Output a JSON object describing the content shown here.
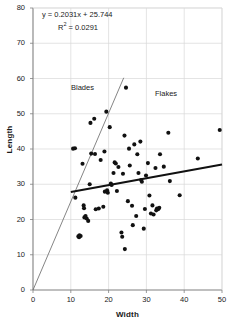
{
  "chart_data": {
    "type": "scatter",
    "title": "",
    "xlabel": "Width",
    "ylabel": "Length",
    "xlim": [
      0,
      50
    ],
    "ylim": [
      0,
      80
    ],
    "xticks": [
      0,
      10,
      20,
      30,
      40,
      50
    ],
    "yticks": [
      0,
      10,
      20,
      30,
      40,
      50,
      60,
      70,
      80
    ],
    "grid": true,
    "legend_position": "none",
    "annotations": [
      {
        "text": "Blades",
        "x": 10.2,
        "y": 58.5
      },
      {
        "text": "Flakes",
        "x": 32.5,
        "y": 56.5
      }
    ],
    "equation": "y = 0.2031x + 25.744",
    "r_squared_label": "R",
    "r_squared_exponent": "2",
    "r_squared_value": "= 0.0291",
    "series": [
      {
        "name": "observations",
        "marker": "filled-circle",
        "color": "#111111",
        "points": [
          [
            10.6,
            40.1
          ],
          [
            11.1,
            40.2
          ],
          [
            11.2,
            26.2
          ],
          [
            12.0,
            15.2
          ],
          [
            12.2,
            15.0
          ],
          [
            12.3,
            15.5
          ],
          [
            12.6,
            15.3
          ],
          [
            13.1,
            35.8
          ],
          [
            13.4,
            24.0
          ],
          [
            13.5,
            23.2
          ],
          [
            13.6,
            20.6
          ],
          [
            13.9,
            21.0
          ],
          [
            14.2,
            20.3
          ],
          [
            14.6,
            19.6
          ],
          [
            15.0,
            30.0
          ],
          [
            15.2,
            47.4
          ],
          [
            15.4,
            38.7
          ],
          [
            16.2,
            48.6
          ],
          [
            16.4,
            38.6
          ],
          [
            16.6,
            22.9
          ],
          [
            17.4,
            23.1
          ],
          [
            17.9,
            36.9
          ],
          [
            18.6,
            23.6
          ],
          [
            18.9,
            39.3
          ],
          [
            19.0,
            27.9
          ],
          [
            19.4,
            50.6
          ],
          [
            19.6,
            28.3
          ],
          [
            19.8,
            27.6
          ],
          [
            20.3,
            46.2
          ],
          [
            20.6,
            30.2
          ],
          [
            20.8,
            29.8
          ],
          [
            21.3,
            33.2
          ],
          [
            21.6,
            36.2
          ],
          [
            21.9,
            35.9
          ],
          [
            22.2,
            28.1
          ],
          [
            22.6,
            34.9
          ],
          [
            23.4,
            16.3
          ],
          [
            23.6,
            15.1
          ],
          [
            23.8,
            33.0
          ],
          [
            24.2,
            43.8
          ],
          [
            24.3,
            11.6
          ],
          [
            24.6,
            57.4
          ],
          [
            25.1,
            25.2
          ],
          [
            25.4,
            40.1
          ],
          [
            25.6,
            35.3
          ],
          [
            26.2,
            23.9
          ],
          [
            26.4,
            18.4
          ],
          [
            26.8,
            41.3
          ],
          [
            27.3,
            21.0
          ],
          [
            27.6,
            38.5
          ],
          [
            27.9,
            33.2
          ],
          [
            28.4,
            42.1
          ],
          [
            28.6,
            31.2
          ],
          [
            28.8,
            30.7
          ],
          [
            29.3,
            17.4
          ],
          [
            29.6,
            23.0
          ],
          [
            29.9,
            32.5
          ],
          [
            30.4,
            36.0
          ],
          [
            30.8,
            26.8
          ],
          [
            31.2,
            21.7
          ],
          [
            31.6,
            24.0
          ],
          [
            31.9,
            21.4
          ],
          [
            32.4,
            34.6
          ],
          [
            32.6,
            22.6
          ],
          [
            32.8,
            23.1
          ],
          [
            33.1,
            22.9
          ],
          [
            33.4,
            23.3
          ],
          [
            33.6,
            38.5
          ],
          [
            34.6,
            35.0
          ],
          [
            35.8,
            44.6
          ],
          [
            36.2,
            30.9
          ],
          [
            38.8,
            26.9
          ],
          [
            43.6,
            37.3
          ],
          [
            49.4,
            45.4
          ]
        ]
      }
    ],
    "lines": [
      {
        "name": "regression-trend",
        "style": "thick",
        "color": "#111111",
        "width_px": 2.2,
        "x0": 10.0,
        "y0": 27.8,
        "x1": 50.0,
        "y1": 35.6
      },
      {
        "name": "blade-flake-divider",
        "style": "thin",
        "color": "#666666",
        "width_px": 0.8,
        "x0": 0.0,
        "y0": 0.0,
        "x1": 24.0,
        "y1": 60.2
      }
    ]
  },
  "axes": {
    "y_tick_labels": [
      "80",
      "70",
      "60",
      "50",
      "40",
      "30",
      "20",
      "10",
      "0"
    ],
    "x_tick_labels": [
      "0",
      "10",
      "20",
      "30",
      "40",
      "50"
    ],
    "y_axis_title": "Length",
    "x_axis_title": "Width"
  },
  "equation_box": {
    "line1": "y = 0.2031x + 25.744",
    "r_label": "R",
    "r_exp": "2",
    "r_rest": " = 0.0291"
  },
  "annotations": {
    "blades": "Blades",
    "flakes": "Flakes"
  },
  "colors": {
    "marker": "#111111",
    "trend_line": "#111111",
    "divider_line": "#666666",
    "grid": "#d9d9d9",
    "axis": "#808080",
    "text": "#1a1a1a",
    "background": "#ffffff"
  }
}
